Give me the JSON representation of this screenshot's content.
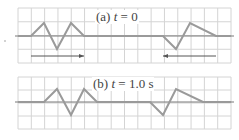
{
  "panels": [
    {
      "id": "a",
      "label_prefix": "(a) ",
      "label_var": "t",
      "label_suffix": " = 0",
      "grid": {
        "x0": 18,
        "x1": 231,
        "y0": 8,
        "y1": 63,
        "cols": 16,
        "rows": 4,
        "axis_y": 36
      },
      "pulses": [
        {
          "points": [
            [
              18,
              36
            ],
            [
              31,
              36
            ],
            [
              44,
              23
            ],
            [
              57,
              49
            ],
            [
              71,
              23
            ],
            [
              84,
              36
            ],
            [
              163,
              36
            ],
            [
              176,
              49
            ],
            [
              190,
              23
            ],
            [
              216,
              36
            ],
            [
              231,
              36
            ]
          ]
        }
      ],
      "arrows": [
        {
          "from": 31,
          "to": 84,
          "y": 56,
          "direction": "right"
        },
        {
          "from": 216,
          "to": 163,
          "y": 56,
          "direction": "left"
        }
      ]
    },
    {
      "id": "b",
      "label_prefix": "(b) ",
      "label_var": "t",
      "label_suffix": " = 1.0 s",
      "grid": {
        "x0": 18,
        "x1": 231,
        "y0": 77,
        "y1": 129,
        "cols": 16,
        "rows": 4,
        "axis_y": 102
      },
      "pulses": [
        {
          "points": [
            [
              18,
              102
            ],
            [
              44,
              102
            ],
            [
              57,
              89
            ],
            [
              71,
              115
            ],
            [
              84,
              89
            ],
            [
              97,
              102
            ],
            [
              150,
              102
            ],
            [
              163,
              115
            ],
            [
              176,
              89
            ],
            [
              203,
              102
            ],
            [
              231,
              102
            ]
          ]
        }
      ],
      "arrows": []
    }
  ],
  "colors": {
    "grid": "#d4d4d4",
    "axis": "#7a7a7a",
    "pulse": "#9a9a9a",
    "arrow": "#555555",
    "text": "#444444"
  }
}
